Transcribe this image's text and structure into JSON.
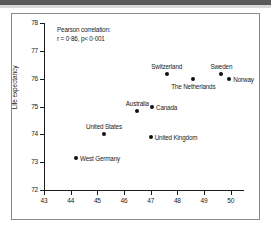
{
  "figure": {
    "annotation_title": "Pearson correlation:",
    "annotation_stat": "r = 0·86, p< 0·001"
  },
  "chart_data": {
    "type": "scatter",
    "title": "",
    "xlabel": "",
    "ylabel": "Life expectancy",
    "xlim": [
      43,
      50.5
    ],
    "ylim": [
      72,
      78
    ],
    "xticks": [
      "43",
      "44",
      "45",
      "46",
      "47",
      "48",
      "49",
      "50"
    ],
    "yticks": [
      "72",
      "73",
      "74",
      "75",
      "76",
      "77",
      "78"
    ],
    "grid": false,
    "legend": "none",
    "annotations": [
      "Pearson correlation:",
      "r = 0·86, p< 0·001"
    ],
    "points": [
      {
        "label": "West Germany",
        "x": 44.2,
        "y": 73.15,
        "label_pos": "right"
      },
      {
        "label": "United States",
        "x": 45.25,
        "y": 74.0,
        "label_pos": "above"
      },
      {
        "label": "Australia",
        "x": 46.5,
        "y": 74.85,
        "label_pos": "above"
      },
      {
        "label": "Canada",
        "x": 47.05,
        "y": 75.0,
        "label_pos": "right"
      },
      {
        "label": "United Kingdom",
        "x": 47.0,
        "y": 73.9,
        "label_pos": "right"
      },
      {
        "label": "Switzerland",
        "x": 47.6,
        "y": 76.15,
        "label_pos": "above"
      },
      {
        "label": "The Netherlands",
        "x": 48.6,
        "y": 76.0,
        "label_pos": "below"
      },
      {
        "label": "Sweden",
        "x": 49.65,
        "y": 76.15,
        "label_pos": "above"
      },
      {
        "label": "Norway",
        "x": 49.95,
        "y": 76.0,
        "label_pos": "right"
      }
    ]
  }
}
